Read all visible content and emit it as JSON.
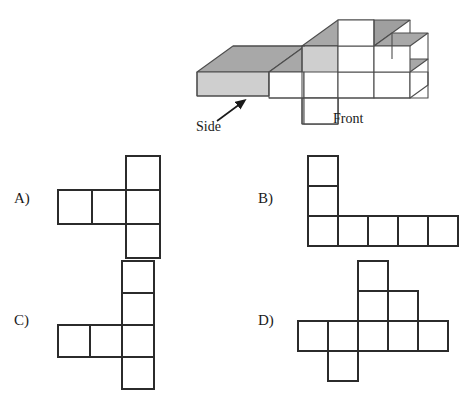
{
  "figure": {
    "name": "isometric-block-figure",
    "labels": {
      "side": "Side",
      "front": "Front"
    },
    "colors": {
      "top_face": "#a8a8a8",
      "left_face": "#cfcfcf",
      "front_face": "#ffffff",
      "outline": "#4d4d4d"
    },
    "description_rows": {
      "front_row_heights": [
        1,
        2,
        3,
        2,
        1
      ],
      "side_arm_length": 3
    }
  },
  "choices": [
    {
      "letter": "A)",
      "id": "a",
      "cell": 34,
      "cols": 3,
      "rows": 3,
      "cells": [
        [
          0,
          0,
          1
        ],
        [
          1,
          1,
          1
        ],
        [
          0,
          0,
          1
        ]
      ]
    },
    {
      "letter": "B)",
      "id": "b",
      "cell": 30,
      "cols": 5,
      "rows": 3,
      "cells": [
        [
          1,
          0,
          0,
          0,
          0
        ],
        [
          1,
          0,
          0,
          0,
          0
        ],
        [
          1,
          1,
          1,
          1,
          1
        ]
      ]
    },
    {
      "letter": "C)",
      "id": "c",
      "cell": 32,
      "cols": 3,
      "rows": 4,
      "cells": [
        [
          0,
          0,
          1
        ],
        [
          0,
          0,
          1
        ],
        [
          1,
          1,
          1
        ],
        [
          0,
          0,
          1
        ]
      ]
    },
    {
      "letter": "D)",
      "id": "d",
      "cell": 30,
      "cols": 5,
      "rows": 4,
      "cells": [
        [
          0,
          0,
          1,
          0,
          0
        ],
        [
          0,
          0,
          1,
          1,
          0
        ],
        [
          1,
          1,
          1,
          1,
          1
        ],
        [
          0,
          1,
          0,
          0,
          0
        ]
      ]
    }
  ]
}
